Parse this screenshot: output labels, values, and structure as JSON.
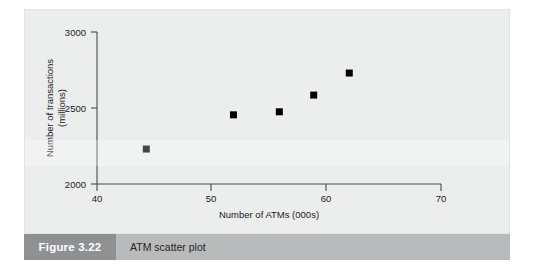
{
  "figure": {
    "number_label": "Figure 3.22",
    "caption": "ATM scatter plot"
  },
  "colors": {
    "panel_background": "#eceded",
    "axis_line": "#4a4a4a",
    "marker": "#000000",
    "caption_bar": "#b9babb",
    "caption_number_box": "#8f9092",
    "caption_number_text": "#ffffff",
    "caption_text": "#262626"
  },
  "chart_data": {
    "type": "scatter",
    "title": "",
    "subtitle": "",
    "xlabel": "Number of ATMs (000s)",
    "ylabel": "Number of transactions (millions)",
    "ylabel_line1": "Number of transactions",
    "ylabel_line2": "(millions)",
    "xlim": [
      40,
      70
    ],
    "ylim": [
      2000,
      3000
    ],
    "xticks": [
      40,
      50,
      60,
      70
    ],
    "xticklabels": [
      "40",
      "50",
      "60",
      "70"
    ],
    "yticks": [
      2000,
      2500,
      3000
    ],
    "yticklabels": [
      "2000",
      "2500",
      "3000"
    ],
    "grid": false,
    "legend": false,
    "marker_shape": "square",
    "series": [
      {
        "name": "ATM data",
        "x": [
          44.3,
          51.9,
          55.9,
          58.9,
          62.0
        ],
        "y": [
          2230,
          2455,
          2475,
          2585,
          2730
        ]
      }
    ],
    "points": [
      {
        "x": 44.3,
        "y": 2230
      },
      {
        "x": 51.9,
        "y": 2455
      },
      {
        "x": 55.9,
        "y": 2475
      },
      {
        "x": 58.9,
        "y": 2585
      },
      {
        "x": 62.0,
        "y": 2730
      }
    ]
  }
}
